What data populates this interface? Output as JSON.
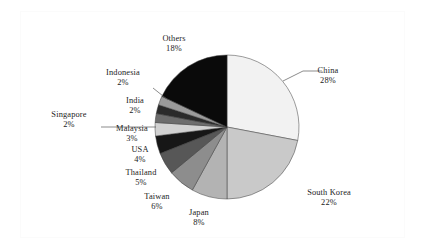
{
  "chart_data": {
    "type": "pie",
    "title": "",
    "subtitle": "",
    "xlabel": "",
    "ylabel": "",
    "grid": false,
    "legend_position": "none",
    "label_format": "name + percent",
    "start_angle_deg": 0,
    "direction": "clockwise",
    "units": "percent",
    "total": 100,
    "categories": [
      "China",
      "South Korea",
      "Japan",
      "Taiwan",
      "Thailand",
      "USA",
      "Malaysia",
      "Singapore",
      "India",
      "Indonesia",
      "Others"
    ],
    "values": [
      28,
      22,
      8,
      6,
      5,
      4,
      3,
      2,
      2,
      2,
      18
    ],
    "slices": [
      {
        "name": "China",
        "percent_label": "28%",
        "value": 28,
        "color": "#f2f2f2"
      },
      {
        "name": "South Korea",
        "percent_label": "22%",
        "value": 22,
        "color": "#c9c9c9"
      },
      {
        "name": "Japan",
        "percent_label": "8%",
        "value": 8,
        "color": "#b3b3b3"
      },
      {
        "name": "Taiwan",
        "percent_label": "6%",
        "value": 6,
        "color": "#8d8d8d"
      },
      {
        "name": "Thailand",
        "percent_label": "5%",
        "value": 5,
        "color": "#575757"
      },
      {
        "name": "USA",
        "percent_label": "4%",
        "value": 4,
        "color": "#171717"
      },
      {
        "name": "Malaysia",
        "percent_label": "3%",
        "value": 3,
        "color": "#d2d2d2"
      },
      {
        "name": "Singapore",
        "percent_label": "2%",
        "value": 2,
        "color": "#6d6d6d"
      },
      {
        "name": "India",
        "percent_label": "2%",
        "value": 2,
        "color": "#2a2a2a"
      },
      {
        "name": "Indonesia",
        "percent_label": "2%",
        "value": 2,
        "color": "#9b9b9b"
      },
      {
        "name": "Others",
        "percent_label": "18%",
        "value": 18,
        "color": "#0a0a0a"
      }
    ]
  },
  "colors": {
    "background": "#ffffff",
    "frame_border": "#fbfbfb",
    "text": "#1b1b1b",
    "leader_line": "#5a5a5a",
    "slice_outline": "#3c3c3c"
  }
}
